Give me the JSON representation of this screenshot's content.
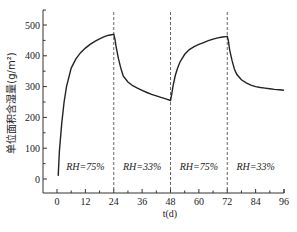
{
  "chart_data": {
    "type": "line",
    "title": "",
    "xlabel": "t(d)",
    "ylabel": "单位面积含湿量(g/m²)",
    "xlim": [
      0,
      96
    ],
    "ylim": [
      0,
      550
    ],
    "x_ticks": [
      0,
      12,
      24,
      36,
      48,
      60,
      72,
      84,
      96
    ],
    "y_ticks": [
      0,
      100,
      200,
      300,
      400,
      500
    ],
    "grid": false,
    "legend": null,
    "series": [
      {
        "name": "moisture content",
        "x": [
          0.5,
          1,
          2,
          3,
          4,
          6,
          8,
          10,
          12,
          14,
          16,
          18,
          20,
          22,
          24,
          24.5,
          25,
          26,
          27,
          28,
          30,
          32,
          34,
          36,
          38,
          40,
          42,
          44,
          46,
          48,
          48.5,
          49,
          50,
          51,
          52,
          54,
          56,
          58,
          60,
          62,
          64,
          66,
          68,
          70,
          72,
          72.5,
          73,
          74,
          75,
          76,
          78,
          80,
          82,
          84,
          86,
          88,
          90,
          92,
          94,
          96
        ],
        "values": [
          10,
          90,
          180,
          250,
          300,
          360,
          390,
          410,
          425,
          437,
          447,
          455,
          462,
          467,
          470,
          455,
          430,
          390,
          360,
          335,
          315,
          303,
          295,
          288,
          281,
          275,
          270,
          265,
          260,
          255,
          275,
          300,
          335,
          360,
          380,
          405,
          420,
          430,
          437,
          443,
          449,
          454,
          458,
          461,
          463,
          448,
          420,
          385,
          358,
          340,
          322,
          312,
          305,
          300,
          297,
          295,
          293,
          291,
          290,
          288
        ]
      }
    ],
    "vertical_lines": [
      24,
      48,
      72
    ],
    "annotations": [
      {
        "text": "RH=75%",
        "x_range": [
          0,
          24
        ]
      },
      {
        "text": "RH=33%",
        "x_range": [
          24,
          48
        ]
      },
      {
        "text": "RH=75%",
        "x_range": [
          48,
          72
        ]
      },
      {
        "text": "RH=33%",
        "x_range": [
          72,
          96
        ]
      }
    ],
    "colors": {
      "line": "#222222",
      "divider": "#555555",
      "axis": "#333333"
    }
  },
  "labels": {
    "xlabel": "t(d)",
    "ylabel": "单位面积含湿量(g/m²)",
    "annotations": [
      "RH=75%",
      "RH=33%",
      "RH=75%",
      "RH=33%"
    ]
  }
}
